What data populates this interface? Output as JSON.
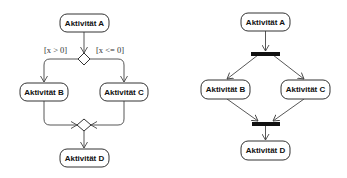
{
  "left_diagram": {
    "type": "decision-merge",
    "nodes": {
      "a": {
        "label": "Aktivität A"
      },
      "b": {
        "label": "Aktivität B"
      },
      "c": {
        "label": "Aktivität C"
      },
      "d": {
        "label": "Aktivität D"
      }
    },
    "guards": {
      "left": "[x > 0]",
      "right": "[x <= 0]"
    }
  },
  "right_diagram": {
    "type": "fork-join",
    "nodes": {
      "a": {
        "label": "Aktivität A"
      },
      "b": {
        "label": "Aktivität B"
      },
      "c": {
        "label": "Aktivität C"
      },
      "d": {
        "label": "Aktivität D"
      }
    }
  },
  "colors": {
    "stroke": "#333333",
    "bar": "#111111",
    "background": "#ffffff"
  }
}
